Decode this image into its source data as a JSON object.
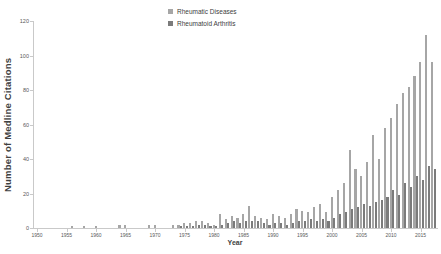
{
  "chart_data": {
    "type": "bar",
    "title": "",
    "xlabel": "Year",
    "ylabel": "Number of Medline Citations",
    "start_year": 1950,
    "end_year": 2017,
    "x_ticks": [
      1950,
      1955,
      1960,
      1965,
      1970,
      1975,
      1980,
      1985,
      1990,
      1995,
      2000,
      2005,
      2010,
      2015
    ],
    "y_ticks": [
      0,
      20,
      40,
      60,
      80,
      100,
      120
    ],
    "ylim": [
      0,
      120
    ],
    "grid": false,
    "legend_position": "top-center",
    "axis_color": "#c9c9c9",
    "tick_label_color": "#595959",
    "title_color": "#3f3f3f",
    "series": [
      {
        "name": "Rheumatic Diseases",
        "color": "#a6a6a6",
        "values": [
          0,
          0,
          0,
          0,
          0,
          0,
          1,
          0,
          1,
          0,
          1,
          0,
          0,
          0,
          2,
          2,
          0,
          0,
          0,
          2,
          2,
          0,
          0,
          2,
          2,
          3,
          3,
          4,
          4,
          3,
          2,
          8,
          5,
          7,
          6,
          8,
          13,
          7,
          6,
          5,
          8,
          7,
          6,
          8,
          11,
          10,
          9,
          12,
          14,
          9,
          18,
          22,
          26,
          45,
          34,
          30,
          38,
          54,
          40,
          58,
          64,
          72,
          78,
          82,
          88,
          96,
          112,
          96
        ]
      },
      {
        "name": "Rheumatoid Arthritis",
        "color": "#7b7b7b",
        "values": [
          0,
          0,
          0,
          0,
          0,
          0,
          0,
          0,
          0,
          0,
          0,
          0,
          0,
          0,
          0,
          0,
          0,
          0,
          0,
          0,
          0,
          0,
          0,
          0,
          1,
          1,
          1,
          2,
          2,
          1,
          1,
          2,
          3,
          4,
          3,
          4,
          4,
          4,
          3,
          2,
          3,
          3,
          2,
          3,
          4,
          4,
          5,
          4,
          5,
          4,
          6,
          8,
          9,
          11,
          12,
          14,
          13,
          15,
          16,
          18,
          22,
          19,
          26,
          24,
          30,
          28,
          36,
          34
        ]
      }
    ]
  }
}
